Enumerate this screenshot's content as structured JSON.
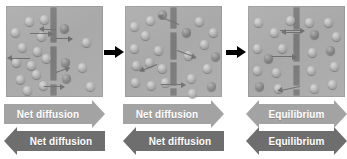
{
  "figure": {
    "panel_width": 97,
    "panel_height": 91,
    "colors": {
      "cell_background": "#a9a9a9",
      "membrane": "#7a7a7a",
      "band_light": "#a3a3a3",
      "band_dark": "#6e6e6e",
      "band_label": "#ffffff",
      "connector_arrow": "#000000",
      "page_background": "#ffffff"
    },
    "connector_arrows": [
      {
        "name": "panel-1-to-2-arrow",
        "x": 104,
        "y": 50,
        "length": 11
      },
      {
        "name": "panel-2-to-3-arrow",
        "x": 226,
        "y": 50,
        "length": 11
      }
    ],
    "panels": [
      {
        "id": "panel-1",
        "state": "net-diffusion",
        "membrane_segments": [
          {
            "x": 45,
            "y": 2,
            "w": 5,
            "h": 34
          },
          {
            "x": 45,
            "y": 41,
            "w": 5,
            "h": 33
          },
          {
            "x": 45,
            "y": 79,
            "w": 5,
            "h": 10
          }
        ],
        "particles": [
          {
            "x": 5,
            "y": 22,
            "shade": "light"
          },
          {
            "x": 19,
            "y": 11,
            "shade": "light"
          },
          {
            "x": 34,
            "y": 9,
            "shade": "light"
          },
          {
            "x": 31,
            "y": 26,
            "shade": "light"
          },
          {
            "x": 12,
            "y": 37,
            "shade": "light"
          },
          {
            "x": 27,
            "y": 41,
            "shade": "light"
          },
          {
            "x": 6,
            "y": 52,
            "shade": "light"
          },
          {
            "x": 21,
            "y": 55,
            "shade": "light"
          },
          {
            "x": 36,
            "y": 48,
            "shade": "light"
          },
          {
            "x": 10,
            "y": 69,
            "shade": "light"
          },
          {
            "x": 26,
            "y": 64,
            "shade": "light"
          },
          {
            "x": 33,
            "y": 75,
            "shade": "light"
          },
          {
            "x": 17,
            "y": 80,
            "shade": "light"
          },
          {
            "x": 54,
            "y": 18,
            "shade": "dark"
          },
          {
            "x": 55,
            "y": 52,
            "shade": "dark"
          },
          {
            "x": 56,
            "y": 68,
            "shade": "dark"
          },
          {
            "x": 76,
            "y": 32,
            "shade": "light"
          },
          {
            "x": 72,
            "y": 57,
            "shade": "light"
          },
          {
            "x": 80,
            "y": 76,
            "shade": "light"
          }
        ],
        "molecule_arrows": [
          {
            "x": 24,
            "y": 27,
            "len": 22,
            "dir": "right"
          },
          {
            "x": 50,
            "y": 23,
            "len": 16,
            "dir": "left"
          },
          {
            "x": 50,
            "y": 32,
            "len": 16,
            "dir": "right"
          },
          {
            "x": 24,
            "y": 52,
            "len": 22,
            "dir": "left"
          },
          {
            "x": 50,
            "y": 66,
            "len": 14,
            "dir": "right",
            "tilt": -20
          },
          {
            "x": 38,
            "y": 80,
            "len": 20,
            "dir": "right"
          }
        ],
        "bands": [
          {
            "name": "band-net-diffusion-right",
            "label": "Net diffusion",
            "direction": "right",
            "tone": "light"
          },
          {
            "name": "band-net-diffusion-left",
            "label": "Net diffusion",
            "direction": "left",
            "tone": "dark"
          }
        ]
      },
      {
        "id": "panel-2",
        "state": "net-diffusion",
        "membrane_segments": [
          {
            "x": 46,
            "y": 2,
            "w": 5,
            "h": 20
          },
          {
            "x": 46,
            "y": 27,
            "w": 5,
            "h": 26
          },
          {
            "x": 46,
            "y": 57,
            "w": 5,
            "h": 22
          },
          {
            "x": 46,
            "y": 83,
            "w": 5,
            "h": 6
          }
        ],
        "particles": [
          {
            "x": 5,
            "y": 16,
            "shade": "light"
          },
          {
            "x": 21,
            "y": 10,
            "shade": "light"
          },
          {
            "x": 33,
            "y": 4,
            "shade": "dark"
          },
          {
            "x": 16,
            "y": 25,
            "shade": "light"
          },
          {
            "x": 5,
            "y": 38,
            "shade": "light"
          },
          {
            "x": 29,
            "y": 40,
            "shade": "light"
          },
          {
            "x": 7,
            "y": 55,
            "shade": "light"
          },
          {
            "x": 20,
            "y": 52,
            "shade": "light"
          },
          {
            "x": 33,
            "y": 58,
            "shade": "light"
          },
          {
            "x": 6,
            "y": 72,
            "shade": "light"
          },
          {
            "x": 22,
            "y": 75,
            "shade": "light"
          },
          {
            "x": 36,
            "y": 72,
            "shade": "light"
          },
          {
            "x": 57,
            "y": 22,
            "shade": "dark"
          },
          {
            "x": 59,
            "y": 45,
            "shade": "light"
          },
          {
            "x": 62,
            "y": 68,
            "shade": "light"
          },
          {
            "x": 70,
            "y": 11,
            "shade": "light"
          },
          {
            "x": 75,
            "y": 34,
            "shade": "light"
          },
          {
            "x": 84,
            "y": 22,
            "shade": "light"
          },
          {
            "x": 86,
            "y": 46,
            "shade": "dark"
          },
          {
            "x": 78,
            "y": 58,
            "shade": "light"
          },
          {
            "x": 82,
            "y": 76,
            "shade": "dark"
          },
          {
            "x": 63,
            "y": 83,
            "shade": "light"
          }
        ],
        "molecule_arrows": [
          {
            "x": 54,
            "y": 18,
            "len": 22,
            "dir": "left",
            "tilt": 22
          },
          {
            "x": 52,
            "y": 44,
            "len": 20,
            "dir": "right",
            "tilt": 20
          },
          {
            "x": 32,
            "y": 58,
            "len": 18,
            "dir": "left",
            "tilt": -22
          },
          {
            "x": 36,
            "y": 78,
            "len": 24,
            "dir": "right"
          }
        ],
        "bands": [
          {
            "name": "band-net-diffusion-right",
            "label": "Net diffusion",
            "direction": "right",
            "tone": "light"
          },
          {
            "name": "band-net-diffusion-left",
            "label": "Net diffusion",
            "direction": "left",
            "tone": "dark"
          }
        ]
      },
      {
        "id": "panel-3",
        "state": "equilibrium",
        "membrane_segments": [
          {
            "x": 46,
            "y": 2,
            "w": 5,
            "h": 21
          },
          {
            "x": 46,
            "y": 28,
            "w": 5,
            "h": 27
          },
          {
            "x": 46,
            "y": 60,
            "w": 5,
            "h": 19
          },
          {
            "x": 46,
            "y": 84,
            "w": 5,
            "h": 5
          }
        ],
        "particles": [
          {
            "x": 6,
            "y": 12,
            "shade": "light"
          },
          {
            "x": 22,
            "y": 22,
            "shade": "light"
          },
          {
            "x": 5,
            "y": 38,
            "shade": "light"
          },
          {
            "x": 30,
            "y": 38,
            "shade": "light"
          },
          {
            "x": 16,
            "y": 48,
            "shade": "dark"
          },
          {
            "x": 5,
            "y": 60,
            "shade": "light"
          },
          {
            "x": 24,
            "y": 62,
            "shade": "light"
          },
          {
            "x": 7,
            "y": 76,
            "shade": "dark"
          },
          {
            "x": 26,
            "y": 78,
            "shade": "light"
          },
          {
            "x": 57,
            "y": 12,
            "shade": "light"
          },
          {
            "x": 62,
            "y": 24,
            "shade": "dark"
          },
          {
            "x": 60,
            "y": 42,
            "shade": "light"
          },
          {
            "x": 59,
            "y": 60,
            "shade": "light"
          },
          {
            "x": 62,
            "y": 78,
            "shade": "light"
          },
          {
            "x": 76,
            "y": 12,
            "shade": "light"
          },
          {
            "x": 84,
            "y": 26,
            "shade": "light"
          },
          {
            "x": 78,
            "y": 40,
            "shade": "dark"
          },
          {
            "x": 82,
            "y": 56,
            "shade": "light"
          },
          {
            "x": 80,
            "y": 74,
            "shade": "light"
          },
          {
            "x": 38,
            "y": 10,
            "shade": "light"
          }
        ],
        "molecule_arrows": [
          {
            "x": 32,
            "y": 24,
            "len": 24,
            "dir": "right"
          },
          {
            "x": 52,
            "y": 26,
            "len": 18,
            "dir": "left"
          },
          {
            "x": 24,
            "y": 50,
            "len": 24,
            "dir": "right"
          },
          {
            "x": 52,
            "y": 80,
            "len": 22,
            "dir": "left",
            "tilt": -12
          }
        ],
        "bands": [
          {
            "name": "band-equilibrium-both-top",
            "label": "Equilibrium",
            "direction": "both",
            "tone": "light"
          },
          {
            "name": "band-equilibrium-both-bottom",
            "label": "Equilibrium",
            "direction": "both",
            "tone": "dark"
          }
        ]
      }
    ]
  }
}
